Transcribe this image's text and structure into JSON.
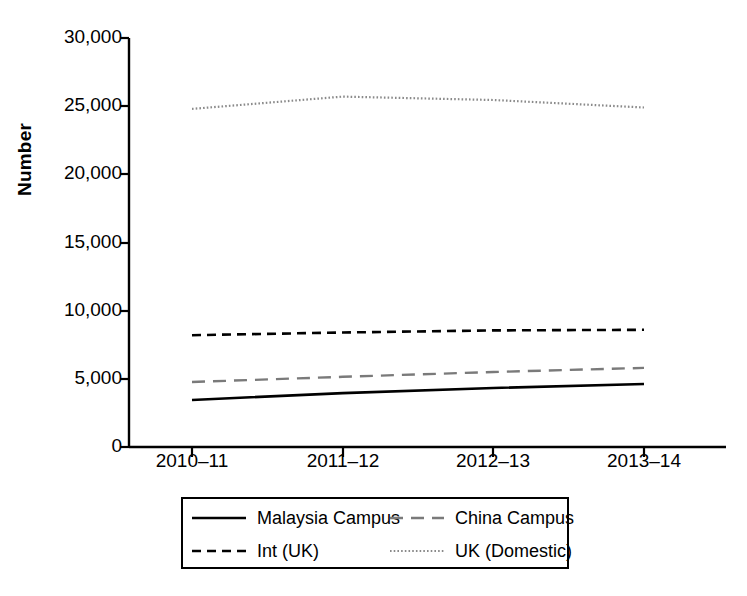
{
  "chart_data": {
    "type": "line",
    "title": "",
    "xlabel": "",
    "ylabel": "Number",
    "categories": [
      "2010–11",
      "2011–12",
      "2012–13",
      "2013–14"
    ],
    "ylim": [
      0,
      30000
    ],
    "yticks": [
      0,
      5000,
      10000,
      15000,
      20000,
      25000,
      30000
    ],
    "ytick_labels": [
      "0",
      "5,000",
      "10,000",
      "15,000",
      "20,000",
      "25,000",
      "30,000"
    ],
    "grid": false,
    "legend_position": "bottom",
    "series": [
      {
        "name": "Malaysia Campus",
        "style": "solid",
        "color": "#000000",
        "values": [
          3450,
          3950,
          4330,
          4620
        ]
      },
      {
        "name": "China Campus",
        "style": "long-dash",
        "color": "#7a7a7a",
        "values": [
          4770,
          5150,
          5500,
          5800
        ]
      },
      {
        "name": "Int (UK)",
        "style": "short-dash",
        "color": "#000000",
        "values": [
          8200,
          8400,
          8550,
          8600
        ]
      },
      {
        "name": "UK (Domestic)",
        "style": "dotted",
        "color": "#8a8a8a",
        "values": [
          24800,
          25700,
          25450,
          24900
        ]
      }
    ]
  },
  "axis": {
    "y_label": "Number",
    "y_tick_labels": [
      "30,000",
      "25,000",
      "20,000",
      "15,000",
      "10,000",
      "5,000",
      "0"
    ],
    "x_tick_labels": [
      "2010–11",
      "2011–12",
      "2012–13",
      "2013–14"
    ]
  },
  "legend": {
    "items": [
      {
        "label": "Malaysia Campus",
        "style": "solid"
      },
      {
        "label": "China Campus",
        "style": "long-dash"
      },
      {
        "label": "Int (UK)",
        "style": "short-dash"
      },
      {
        "label": "UK (Domestic)",
        "style": "dotted"
      }
    ]
  },
  "colors": {
    "axis": "#000000",
    "background": "#ffffff",
    "grey_series": "#7a7a7a",
    "light_grey_series": "#8a8a8a"
  }
}
